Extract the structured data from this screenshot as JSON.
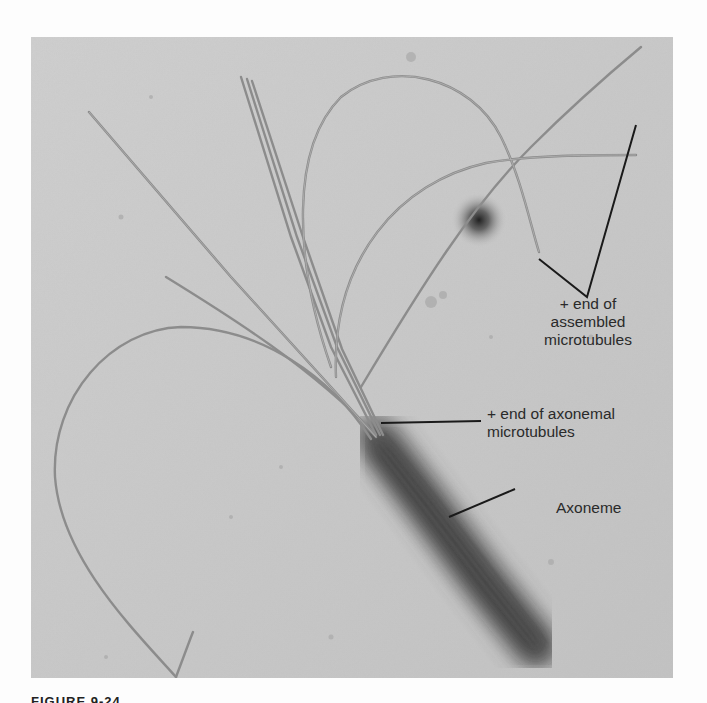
{
  "figure": {
    "caption_fragment": "FIGURE 9-24",
    "labels": {
      "assembled_plus_end": [
        "+ end of",
        "assembled",
        "microtubules"
      ],
      "axonemal_plus_end": [
        "+ end of axonemal",
        "microtubules"
      ],
      "axoneme": "Axoneme"
    },
    "colors": {
      "background": "#c8c8c8",
      "filament": "#8a8a8a",
      "axoneme": "#3a3a3a",
      "leader_line": "#1a1a1a",
      "text": "#2a2a2a"
    }
  }
}
